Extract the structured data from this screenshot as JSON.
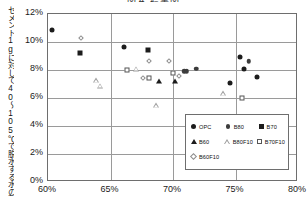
{
  "chart": {
    "title": "図４ 結果図",
    "ylabel": "セメント1gに対して40～105℃で脱水する水の割合",
    "xlabel": ""
  },
  "axes": {
    "yticks": [
      "0%",
      "2%",
      "4%",
      "6%",
      "8%",
      "10%",
      "12%"
    ],
    "xticks": [
      "60%",
      "65%",
      "70%",
      "75%",
      "80%"
    ]
  },
  "legend": {
    "rows": [
      [
        {
          "label": "OPC",
          "marker": "filled-circle"
        },
        {
          "label": "B80",
          "marker": "grey-circle"
        },
        {
          "label": "B70",
          "marker": "filled-square"
        }
      ],
      [
        {
          "label": "B60",
          "marker": "filled-triangle"
        },
        {
          "label": "B80F10",
          "marker": "open-triangle"
        },
        {
          "label": "B70F10",
          "marker": "open-square"
        }
      ],
      [
        {
          "label": "B60F10",
          "marker": "open-diamond"
        }
      ]
    ]
  },
  "chart_data": {
    "type": "scatter",
    "title": "図４ 結果図",
    "xlabel": "",
    "ylabel": "セメント1gに対して40～105℃で脱水する水の割合",
    "xlim": [
      0.6,
      0.8
    ],
    "ylim": [
      0.0,
      0.12
    ],
    "xticks": [
      0.6,
      0.65,
      0.7,
      0.75,
      0.8
    ],
    "yticks": [
      0.0,
      0.02,
      0.04,
      0.06,
      0.08,
      0.1,
      0.12
    ],
    "grid": true,
    "legend_position": "lower-right",
    "series": [
      {
        "name": "OPC",
        "marker": "filled-circle",
        "color": "#1c1c1c",
        "points": [
          {
            "x": 0.603,
            "y": 0.1085
          },
          {
            "x": 0.661,
            "y": 0.0965
          },
          {
            "x": 0.7535,
            "y": 0.0893
          },
          {
            "x": 0.7565,
            "y": 0.081
          },
          {
            "x": 0.7455,
            "y": 0.071
          },
          {
            "x": 0.7675,
            "y": 0.0748
          }
        ]
      },
      {
        "name": "B80",
        "marker": "grey-circle",
        "color": "#3c3c3c",
        "points": [
          {
            "x": 0.709,
            "y": 0.0792
          },
          {
            "x": 0.711,
            "y": 0.079
          },
          {
            "x": 0.7185,
            "y": 0.0808
          },
          {
            "x": 0.7605,
            "y": 0.0863
          }
        ]
      },
      {
        "name": "B70",
        "marker": "filled-square",
        "color": "#1c1c1c",
        "points": [
          {
            "x": 0.6255,
            "y": 0.0918
          },
          {
            "x": 0.68,
            "y": 0.0945
          }
        ]
      },
      {
        "name": "B60",
        "marker": "filled-triangle",
        "color": "#1c1c1c",
        "points": [
          {
            "x": 0.689,
            "y": 0.0718
          },
          {
            "x": 0.7015,
            "y": 0.0718
          }
        ]
      },
      {
        "name": "B80F10",
        "marker": "open-triangle",
        "color": "#9d9d9d",
        "points": [
          {
            "x": 0.6385,
            "y": 0.0728
          },
          {
            "x": 0.6415,
            "y": 0.0723
          },
          {
            "x": 0.67,
            "y": 0.088
          },
          {
            "x": 0.686,
            "y": 0.0655
          },
          {
            "x": 0.74,
            "y": 0.0777
          }
        ]
      },
      {
        "name": "B70F10",
        "marker": "open-square",
        "color": "#555555",
        "points": [
          {
            "x": 0.663,
            "y": 0.08
          },
          {
            "x": 0.681,
            "y": 0.0745
          },
          {
            "x": 0.7,
            "y": 0.078
          },
          {
            "x": 0.7555,
            "y": 0.0603
          }
        ]
      },
      {
        "name": "B60F10",
        "marker": "open-diamond",
        "color": "#8d8d8d",
        "points": [
          {
            "x": 0.6245,
            "y": 0.1043
          },
          {
            "x": 0.679,
            "y": 0.088
          },
          {
            "x": 0.6955,
            "y": 0.088
          },
          {
            "x": 0.6745,
            "y": 0.0758
          },
          {
            "x": 0.703,
            "y": 0.0775
          }
        ]
      }
    ]
  }
}
